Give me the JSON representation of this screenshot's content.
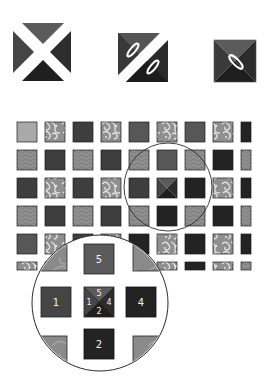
{
  "colors": {
    "background": "#ffffff",
    "outline": "#1a1a1a",
    "light": "#a9a9a9",
    "mid": "#575757",
    "dark": "#3e3e3e",
    "very_dark": "#232323",
    "texture": "#8a8a8a",
    "paisley": "#9a9a9a",
    "tri_top": "#5b5b5b",
    "tri_left": "#454545",
    "tri_right": "#2d2d2d",
    "tri_bottom": "#1f1f1f"
  },
  "steps": [
    {
      "name": "four-triangles-separated",
      "x": 13,
      "y": 23,
      "size": 58
    },
    {
      "name": "two-half-square-triangles-with-needles",
      "x": 118,
      "y": 33,
      "size": 50
    },
    {
      "name": "sewn-quarter-square-block-with-needle",
      "x": 214,
      "y": 40,
      "size": 42
    }
  ],
  "grid": {
    "origin_x": 17,
    "origin_y": 122,
    "pitch": 28,
    "cell": 20,
    "rows": [
      [
        "light",
        "paisley",
        "dark",
        "paisley",
        "mid",
        "paisley",
        "mid",
        "paisley",
        "very_dark"
      ],
      [
        "texture",
        "dark",
        "texture",
        "dark",
        "texture",
        "mid",
        "texture",
        "very_dark",
        "texture"
      ],
      [
        "dark",
        "paisley",
        "dark",
        "paisley",
        "dark",
        "x-block",
        "very_dark",
        "paisley",
        "very_dark"
      ],
      [
        "texture",
        "dark",
        "texture",
        "dark",
        "texture",
        "very_dark",
        "texture",
        "very_dark",
        "texture"
      ],
      [
        "mid",
        "paisley",
        "dark",
        "paisley",
        "very_dark",
        "paisley",
        "very_dark",
        "paisley",
        "very_dark"
      ],
      [
        "paisley",
        "texture",
        "dark",
        "paisley",
        "very_dark",
        "paisley",
        "very_dark",
        "paisley",
        "texture"
      ]
    ]
  },
  "small_circle": {
    "cx": 168,
    "cy": 187,
    "r": 44
  },
  "magnifier": {
    "cx": 100,
    "cy": 303,
    "r": 68,
    "labels": {
      "top": "5",
      "left": "1",
      "right": "4",
      "bottom": "2",
      "center_top": "5",
      "center_left": "1",
      "center_right": "4",
      "center_bottom": "2"
    }
  }
}
